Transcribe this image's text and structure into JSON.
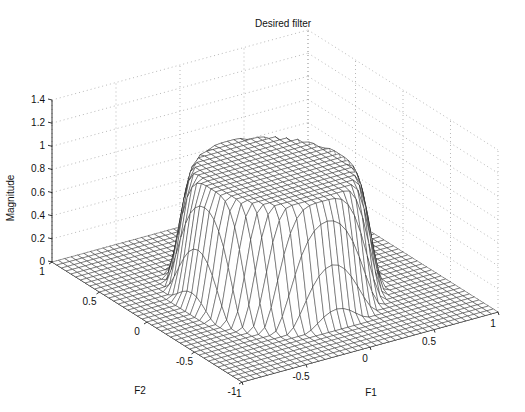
{
  "chart_data": {
    "type": "surface3d",
    "title": "Desired filter",
    "xlabel": "F1",
    "ylabel": "F2",
    "zlabel": "Magnitude",
    "x_range": [
      -1,
      1
    ],
    "y_range": [
      -1,
      1
    ],
    "zlim": [
      0,
      1.4
    ],
    "x_ticks": [
      "-1",
      "-0.5",
      "0",
      "0.5",
      "1"
    ],
    "y_ticks": [
      "-1",
      "-0.5",
      "0",
      "0.5",
      "1"
    ],
    "z_ticks": [
      "0",
      "0.2",
      "0.4",
      "0.6",
      "0.8",
      "1",
      "1.2",
      "1.4"
    ],
    "grid": true,
    "passband_radius": 0.5,
    "stopband_radius": 0.7,
    "peak_magnitude": 1.0,
    "mesh_size": 41
  }
}
